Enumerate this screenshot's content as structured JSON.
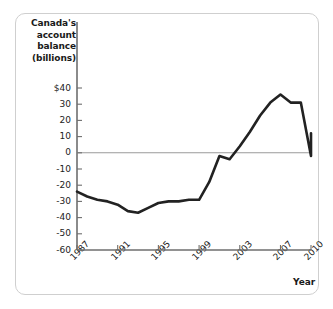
{
  "figure": {
    "border_color": "#cfcfcf",
    "background": "#ffffff"
  },
  "chart_data": {
    "type": "line",
    "title": "",
    "ylabel": "Canada's account balance (billions)",
    "ylabel_lines": [
      "Canada's",
      "account",
      "balance",
      "(billions)"
    ],
    "xlabel": "Year",
    "x": [
      1987,
      1988,
      1989,
      1990,
      1991,
      1992,
      1993,
      1994,
      1995,
      1996,
      1997,
      1998,
      1999,
      2000,
      2001,
      2002,
      2003,
      2004,
      2005,
      2006,
      2007,
      2008,
      2009,
      2010
    ],
    "values": [
      -24,
      -27,
      -29,
      -30,
      -32,
      -36,
      -37,
      -34,
      -31,
      -30,
      -30,
      -29,
      -29,
      -18,
      -2,
      -4,
      4,
      13,
      23,
      31,
      36,
      31,
      31,
      -2
    ],
    "series": [
      {
        "name": "Canada's account balance",
        "color": "#222222",
        "values": [
          -24,
          -27,
          -29,
          -30,
          -32,
          -36,
          -37,
          -34,
          -31,
          -30,
          -30,
          -29,
          -29,
          -18,
          -2,
          -4,
          4,
          13,
          23,
          31,
          36,
          31,
          31,
          -2
        ]
      }
    ],
    "last_point": {
      "x": 2010,
      "y": 12
    },
    "xlim": [
      1987,
      2010
    ],
    "ylim": [
      -60,
      40
    ],
    "yticks": [
      40,
      30,
      20,
      10,
      0,
      -10,
      -20,
      -30,
      -40,
      -50,
      -60
    ],
    "ytick_labels": [
      "$40",
      "30",
      "20",
      "10",
      "0",
      "-10",
      "-20",
      "-30",
      "-40",
      "-50",
      "-60"
    ],
    "xticks": [
      1987,
      1991,
      1995,
      1999,
      2003,
      2007,
      2010
    ],
    "xtick_labels": [
      "1987",
      "1991",
      "1995",
      "1999",
      "2003",
      "2007",
      "2010"
    ],
    "grid": false,
    "zero_line": true,
    "legend": null,
    "line_color": "#222222",
    "axis_color": "#6e6e6e"
  }
}
